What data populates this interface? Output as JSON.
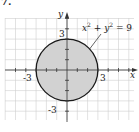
{
  "problem_number": "7.",
  "chart_data": {
    "type": "region",
    "title": "",
    "equation": {
      "x": "x",
      "sup1": "2",
      "plus": " + ",
      "y": "y",
      "sup2": "2",
      "rhs": " = 9"
    },
    "region": {
      "shape": "circle",
      "center": [
        0,
        0
      ],
      "radius": 3,
      "filled": true,
      "boundary": "solid"
    },
    "xlabel": "x",
    "ylabel": "y",
    "xlim": [
      -6,
      6
    ],
    "ylim": [
      -5,
      5
    ],
    "grid": true,
    "tick_labels": {
      "x": [
        "-3",
        "3"
      ],
      "y": [
        "3",
        "-3"
      ]
    },
    "colors": {
      "fill": "#d2d2d2",
      "boundary": "#1a1a1a",
      "grid": "#cfcfcf",
      "axis": "#333333"
    }
  }
}
